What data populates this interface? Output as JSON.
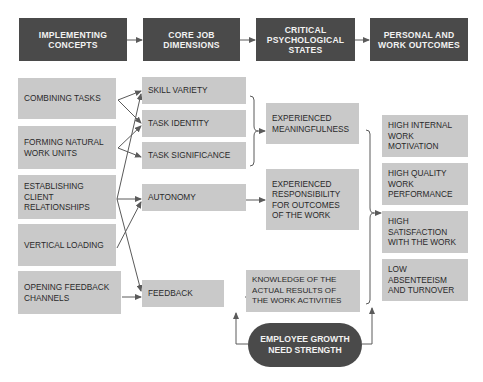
{
  "headers": [
    {
      "label": "IMPLEMENTING\nCONCEPTS"
    },
    {
      "label": "CORE JOB\nDIMENSIONS"
    },
    {
      "label": "CRITICAL\nPSYCHOLOGICAL\nSTATES"
    },
    {
      "label": "PERSONAL AND\nWORK OUTCOMES"
    }
  ],
  "implementing_concepts": [
    {
      "label": "COMBINING TASKS"
    },
    {
      "label": "FORMING NATURAL\nWORK UNITS"
    },
    {
      "label": "ESTABLISHING\nCLIENT\nRELATIONSHIPS"
    },
    {
      "label": "VERTICAL LOADING"
    },
    {
      "label": "OPENING FEEDBACK\nCHANNELS"
    }
  ],
  "core_job_dimensions": [
    {
      "label": "SKILL VARIETY"
    },
    {
      "label": "TASK IDENTITY"
    },
    {
      "label": "TASK SIGNIFICANCE"
    },
    {
      "label": "AUTONOMY"
    },
    {
      "label": "FEEDBACK"
    }
  ],
  "critical_psychological_states": [
    {
      "label": "EXPERIENCED\nMEANINGFULNESS"
    },
    {
      "label": "EXPERIENCED\nRESPONSIBILITY\nFOR OUTCOMES\nOF THE WORK"
    },
    {
      "label": "KNOWLEDGE OF THE\nACTUAL RESULTS OF\nTHE WORK ACTIVITIES"
    }
  ],
  "outcomes": [
    {
      "label": "HIGH INTERNAL\nWORK\nMOTIVATION"
    },
    {
      "label": "HIGH QUALITY\nWORK\nPERFORMANCE"
    },
    {
      "label": "HIGH\nSATISFACTION\nWITH THE WORK"
    },
    {
      "label": "LOW\nABSENTEEISM\nAND TURNOVER"
    }
  ],
  "moderator": {
    "label": "EMPLOYEE GROWTH\nNEED STRENGTH"
  },
  "colors": {
    "dark_box": "#4a4a4a",
    "light_box": "#c9c9c9",
    "line": "#5a5a5a"
  }
}
